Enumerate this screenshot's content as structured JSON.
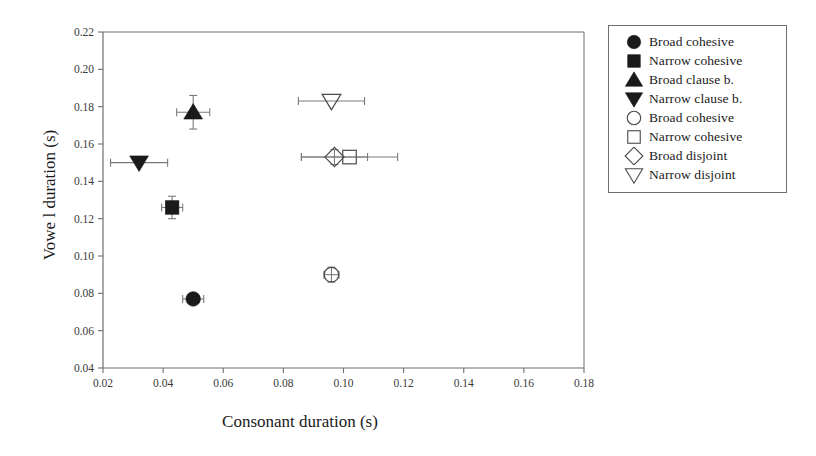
{
  "chart_data": {
    "type": "scatter",
    "title": "",
    "xlabel": "Consonant duration (s)",
    "ylabel": "Vowe l duration (s)",
    "xlim": [
      0.02,
      0.18
    ],
    "ylim": [
      0.04,
      0.22
    ],
    "xticks": [
      "0.02",
      "0.04",
      "0.06",
      "0.08",
      "0.10",
      "0.12",
      "0.14",
      "0.16",
      "0.18"
    ],
    "yticks": [
      "0.04",
      "0.06",
      "0.08",
      "0.10",
      "0.12",
      "0.14",
      "0.16",
      "0.18",
      "0.20",
      "0.22"
    ],
    "xtick_values": [
      0.02,
      0.04,
      0.06,
      0.08,
      0.1,
      0.12,
      0.14,
      0.16,
      0.18
    ],
    "ytick_values": [
      0.04,
      0.06,
      0.08,
      0.1,
      0.12,
      0.14,
      0.16,
      0.18,
      0.2,
      0.22
    ],
    "grid": false,
    "legend_position": "outside-right-top",
    "marker_color": "#1a1a1a",
    "axis_color": "#6f6f6f",
    "series": [
      {
        "name": "Broad cohesive",
        "marker": "circle",
        "fill": "filled",
        "x": 0.05,
        "y": 0.077,
        "xerr": 0.0035,
        "yerr": 0.0025
      },
      {
        "name": "Narrow cohesive",
        "marker": "square",
        "fill": "filled",
        "x": 0.043,
        "y": 0.126,
        "xerr": 0.0035,
        "yerr": 0.006
      },
      {
        "name": "Broad clause b.",
        "marker": "triangle-up",
        "fill": "filled",
        "x": 0.05,
        "y": 0.177,
        "xerr": 0.0055,
        "yerr": 0.009
      },
      {
        "name": "Narrow clause b.",
        "marker": "triangle-down",
        "fill": "filled",
        "x": 0.032,
        "y": 0.15,
        "xerr": 0.0095,
        "yerr": 0.0
      },
      {
        "name": "Broad cohesive",
        "marker": "circle",
        "fill": "open",
        "x": 0.096,
        "y": 0.09,
        "xerr": 0.0025,
        "yerr": 0.004
      },
      {
        "name": "Narrow cohesive",
        "marker": "square",
        "fill": "open",
        "x": 0.102,
        "y": 0.153,
        "xerr": 0.016,
        "yerr": 0.0
      },
      {
        "name": "Broad disjoint",
        "marker": "diamond",
        "fill": "open",
        "x": 0.097,
        "y": 0.153,
        "xerr": 0.011,
        "yerr": 0.004
      },
      {
        "name": "Narrow disjoint",
        "marker": "triangle-down",
        "fill": "open",
        "x": 0.096,
        "y": 0.183,
        "xerr": 0.011,
        "yerr": 0.0
      }
    ]
  },
  "legend": {
    "items": [
      {
        "label": "Broad cohesive",
        "marker": "circle",
        "fill": "filled"
      },
      {
        "label": "Narrow cohesive",
        "marker": "square",
        "fill": "filled"
      },
      {
        "label": "Broad clause b.",
        "marker": "triangle-up",
        "fill": "filled"
      },
      {
        "label": "Narrow clause b.",
        "marker": "triangle-down",
        "fill": "filled"
      },
      {
        "label": "Broad cohesive",
        "marker": "circle",
        "fill": "open"
      },
      {
        "label": "Narrow cohesive",
        "marker": "square",
        "fill": "open"
      },
      {
        "label": "Broad disjoint",
        "marker": "diamond",
        "fill": "open"
      },
      {
        "label": "Narrow disjoint",
        "marker": "triangle-down",
        "fill": "open"
      }
    ]
  }
}
